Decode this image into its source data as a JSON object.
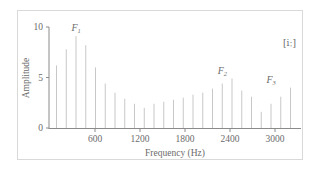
{
  "chart_data": {
    "type": "bar",
    "title": "",
    "annotation": "[iː]",
    "xlabel": "Frequency (Hz)",
    "ylabel": "Amplitude",
    "xlim": [
      0,
      3300
    ],
    "ylim": [
      0,
      10
    ],
    "xticks": [
      600,
      1200,
      1800,
      2400,
      3000
    ],
    "yticks": [
      0,
      5,
      10
    ],
    "grid": false,
    "legend": null,
    "x": [
      80,
      210,
      340,
      470,
      600,
      730,
      860,
      990,
      1120,
      1250,
      1380,
      1510,
      1640,
      1770,
      1900,
      2030,
      2160,
      2290,
      2420,
      2550,
      2680,
      2810,
      2940,
      3070,
      3200
    ],
    "values": [
      6.2,
      7.8,
      9.1,
      8.2,
      6.0,
      4.4,
      3.5,
      2.9,
      2.4,
      2.0,
      2.4,
      2.6,
      2.8,
      3.0,
      3.3,
      3.5,
      3.9,
      4.4,
      4.9,
      3.7,
      3.1,
      1.6,
      2.4,
      3.1,
      4.0
    ],
    "formants": [
      {
        "label": "F",
        "sub": "1",
        "x": 340,
        "y": 9.1
      },
      {
        "label": "F",
        "sub": "2",
        "x": 2290,
        "y": 4.9
      },
      {
        "label": "F",
        "sub": "3",
        "x": 2940,
        "y": 4.0
      }
    ]
  },
  "labels": {
    "xlabel": "Frequency (Hz)",
    "ylabel": "Amplitude",
    "annotation": "[iː]",
    "xticks": [
      "600",
      "1200",
      "1800",
      "2400",
      "3000"
    ],
    "yticks": [
      "0",
      "5",
      "10"
    ]
  },
  "colors": {
    "bar": "#c8c8c8",
    "axis": "#8a8a8a",
    "frame": "#d9d9d9",
    "text": "#6b6b6b"
  }
}
